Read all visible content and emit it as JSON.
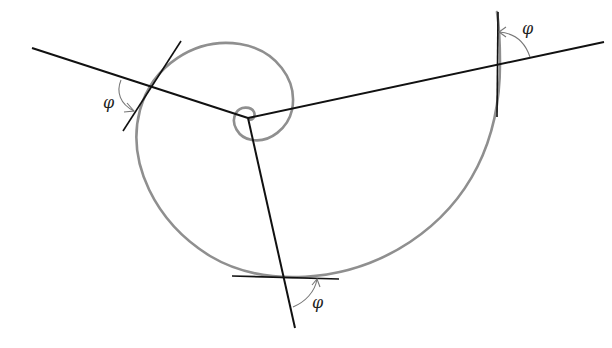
{
  "diagram": {
    "colors": {
      "background": "#ffffff",
      "spiral": "#8f8f8f",
      "rays": "#111111",
      "tangents": "#111111",
      "angle_arcs": "#777777",
      "labels": "#222222"
    },
    "pole": {
      "x": 248,
      "y": 118
    },
    "rays": [
      {
        "name": "left",
        "from": [
          248,
          118
        ],
        "to": [
          32,
          48
        ]
      },
      {
        "name": "right",
        "from": [
          248,
          118
        ],
        "to": [
          604,
          42
        ]
      },
      {
        "name": "bottom",
        "from": [
          248,
          118
        ],
        "to": [
          295,
          328
        ]
      }
    ],
    "tangent_points": [
      {
        "name": "left",
        "point": [
          152,
          87
        ],
        "tangent_from": [
          123,
          131
        ],
        "tangent_to": [
          181,
          41
        ]
      },
      {
        "name": "right",
        "point": [
          500,
          64
        ],
        "tangent_from": [
          498,
          12
        ],
        "tangent_to": [
          497,
          117
        ]
      },
      {
        "name": "bottom",
        "point": [
          285,
          277
        ],
        "tangent_from": [
          232,
          276
        ],
        "tangent_to": [
          339,
          279
        ]
      }
    ],
    "labels": [
      {
        "name": "phi-left",
        "text": "φ",
        "x": 103,
        "y": 108
      },
      {
        "name": "phi-right",
        "text": "φ",
        "x": 522,
        "y": 34
      },
      {
        "name": "phi-bottom",
        "text": "φ",
        "x": 312,
        "y": 308
      }
    ]
  }
}
